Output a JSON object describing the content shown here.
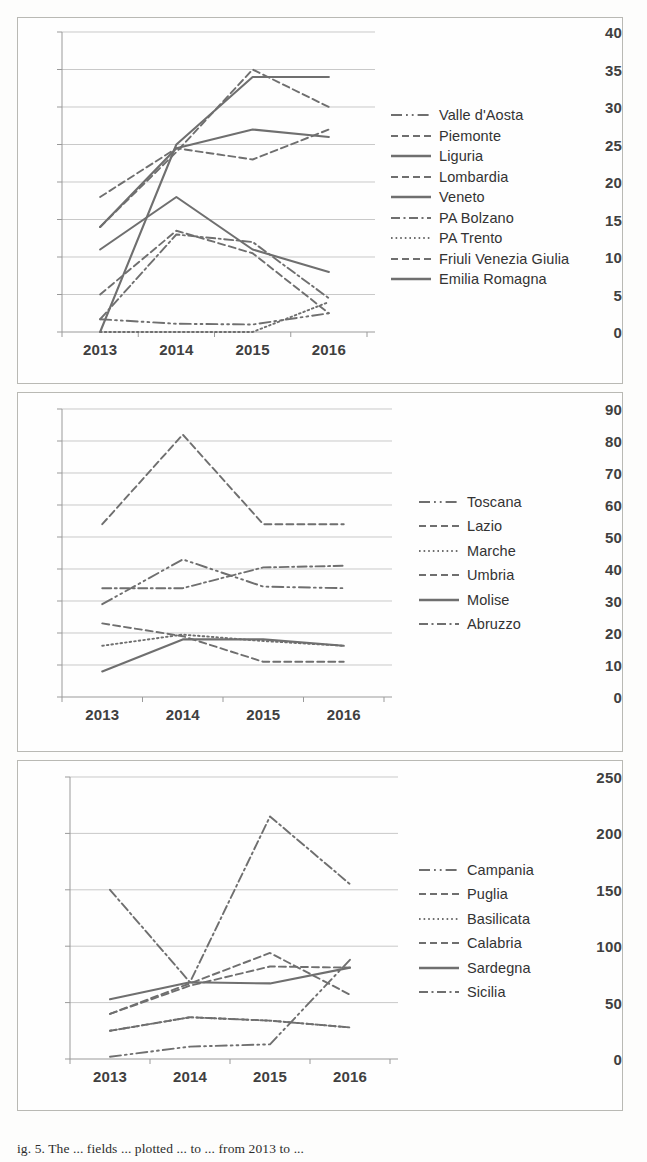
{
  "figure": {
    "caption": "ig. 5. The ... fields ... plotted ... to ... from 2013 to ...",
    "background": "#fdfdfc",
    "line_color": "#6f6f6f",
    "grid_color": "#c9c9c9",
    "axis_color": "#9a9a9a"
  },
  "charts": [
    {
      "id": "chart-north",
      "type": "line",
      "title": "",
      "xlabel": "",
      "ylabel": "",
      "categories": [
        "2013",
        "2014",
        "2015",
        "2016"
      ],
      "xticks": [
        "2013",
        "2014",
        "2015",
        "2016"
      ],
      "yticks": [
        0,
        5,
        10,
        15,
        20,
        25,
        30,
        35,
        40
      ],
      "ylim": [
        0,
        40
      ],
      "grid": true,
      "legend_position": "right",
      "series": [
        {
          "name": "Valle d'Aosta",
          "dash": "long-dot-dot",
          "values": [
            1.7,
            1.1,
            1.0,
            2.5
          ]
        },
        {
          "name": "Piemonte",
          "dash": "dashed",
          "values": [
            5.0,
            13.5,
            10.5,
            2.5
          ]
        },
        {
          "name": "Liguria",
          "dash": "solid",
          "values": [
            0.0,
            25.0,
            34.0,
            34.0
          ]
        },
        {
          "name": "Lombardia",
          "dash": "dashed",
          "values": [
            14.0,
            24.0,
            35.0,
            30.0
          ]
        },
        {
          "name": "Veneto",
          "dash": "solid",
          "values": [
            11.0,
            18.0,
            11.0,
            8.0
          ]
        },
        {
          "name": "PA Bolzano",
          "dash": "dash-dot",
          "values": [
            1.7,
            13.0,
            12.0,
            4.5
          ]
        },
        {
          "name": "PA Trento",
          "dash": "dotted",
          "values": [
            0.0,
            0.0,
            0.0,
            4.0
          ]
        },
        {
          "name": "Friuli Venezia Giulia",
          "dash": "dashed",
          "values": [
            18.0,
            24.5,
            23.0,
            27.0
          ]
        },
        {
          "name": "Emilia Romagna",
          "dash": "solid",
          "values": [
            14.0,
            24.5,
            27.0,
            26.0
          ]
        }
      ]
    },
    {
      "id": "chart-center",
      "type": "line",
      "title": "",
      "xlabel": "",
      "ylabel": "",
      "categories": [
        "2013",
        "2014",
        "2015",
        "2016"
      ],
      "xticks": [
        "2013",
        "2014",
        "2015",
        "2016"
      ],
      "yticks": [
        0,
        10,
        20,
        30,
        40,
        50,
        60,
        70,
        80,
        90
      ],
      "ylim": [
        0,
        90
      ],
      "grid": true,
      "legend_position": "right",
      "series": [
        {
          "name": "Toscana",
          "dash": "long-dot-dot",
          "values": [
            29.0,
            43.0,
            34.5,
            34.0
          ]
        },
        {
          "name": "Lazio",
          "dash": "dashed",
          "values": [
            54.0,
            82.0,
            54.0,
            54.0
          ]
        },
        {
          "name": "Marche",
          "dash": "dotted",
          "values": [
            16.0,
            19.5,
            17.5,
            16.0
          ]
        },
        {
          "name": "Umbria",
          "dash": "dashed",
          "values": [
            23.0,
            19.0,
            11.0,
            11.0
          ]
        },
        {
          "name": "Molise",
          "dash": "solid",
          "values": [
            8.0,
            18.0,
            18.0,
            16.0
          ]
        },
        {
          "name": "Abruzzo",
          "dash": "dash-dot",
          "values": [
            34.0,
            34.0,
            40.5,
            41.0
          ]
        }
      ]
    },
    {
      "id": "chart-south",
      "type": "line",
      "title": "",
      "xlabel": "",
      "ylabel": "",
      "categories": [
        "2013",
        "2014",
        "2015",
        "2016"
      ],
      "xticks": [
        "2013",
        "2014",
        "2015",
        "2016"
      ],
      "yticks": [
        0,
        50,
        100,
        150,
        200,
        250
      ],
      "ylim": [
        0,
        250
      ],
      "grid": true,
      "legend_position": "right",
      "series": [
        {
          "name": "Campania",
          "dash": "long-dot-dot",
          "values": [
            2.0,
            11.0,
            13.0,
            88.0
          ]
        },
        {
          "name": "Puglia",
          "dash": "dashed",
          "values": [
            25.0,
            37.0,
            34.0,
            28.0
          ]
        },
        {
          "name": "Basilicata",
          "dash": "dotted",
          "values": [
            25.0,
            37.0,
            34.0,
            28.0
          ]
        },
        {
          "name": "Calabria",
          "dash": "dashed",
          "values": [
            40.0,
            67.0,
            94.0,
            57.0
          ]
        },
        {
          "name": "Sardegna",
          "dash": "solid",
          "values": [
            53.0,
            68.0,
            67.0,
            81.0
          ]
        },
        {
          "name": "Sicilia",
          "dash": "dash-dot",
          "values": [
            150.0,
            68.0,
            215.0,
            155.0
          ]
        }
      ],
      "extra_series": [
        {
          "name": "Puglia",
          "dash": "dashed",
          "values": [
            40.0,
            65.0,
            82.0,
            81.0
          ]
        }
      ]
    }
  ]
}
